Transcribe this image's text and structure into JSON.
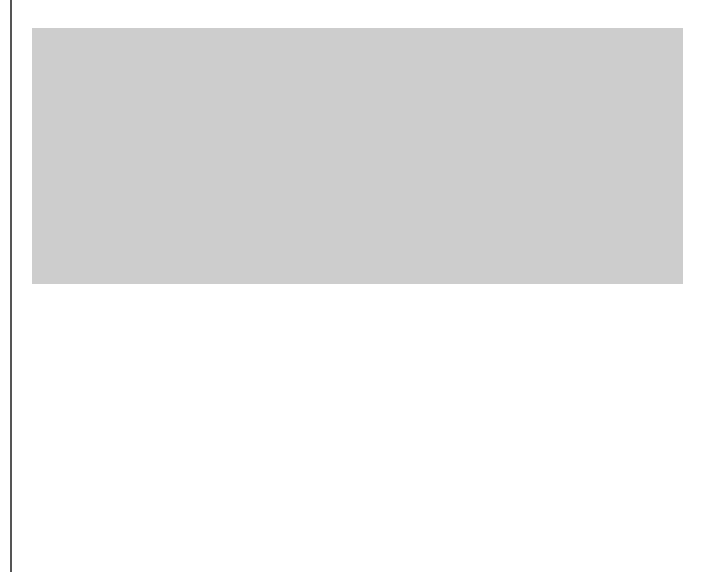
{
  "diagram": {
    "regions": {
      "atmosphere": "atmosphere",
      "land": "land",
      "oceans": "oceans",
      "humus": "humus",
      "detritus": "detritus",
      "sediments": "sediments",
      "rocks": "rocks/fossil fuels",
      "organic_matter": "organic matter in sediment"
    },
    "organic_matter_lines": [
      "organic matter",
      "in sediment"
    ],
    "labels": {
      "A_main": "A",
      "A_inner": "A",
      "A_ocean": "A",
      "B": "B",
      "C": "C",
      "D": "D",
      "E": "E",
      "F": "F",
      "G": "G",
      "H": "H",
      "I": "I"
    },
    "colors": {
      "outer_bg": "#cdcdcd",
      "sky": "#ececec",
      "land": "#a9a9a9",
      "ocean": "#8e8e8e",
      "humus": "#7e7e7e",
      "detritus_box": "#d4d4d4",
      "sediment": "#c9c9c9",
      "arrow": "#1a1a1a"
    }
  }
}
